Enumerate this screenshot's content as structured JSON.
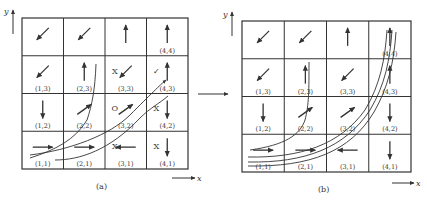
{
  "panels": [
    {
      "id": "a",
      "caption": "(a)",
      "x_axis": "x",
      "y_axis": "y",
      "cells": [
        {
          "col": 1,
          "row": 4,
          "label": "",
          "arrow": "down-left",
          "mark": ""
        },
        {
          "col": 2,
          "row": 4,
          "label": "",
          "arrow": "down-left",
          "mark": ""
        },
        {
          "col": 3,
          "row": 4,
          "label": "",
          "arrow": "up",
          "mark": ""
        },
        {
          "col": 4,
          "row": 4,
          "label": "(4,4)",
          "arrow": "up",
          "mark": ""
        },
        {
          "col": 1,
          "row": 3,
          "label": "(1,3)",
          "arrow": "down-left",
          "mark": ""
        },
        {
          "col": 2,
          "row": 3,
          "label": "(2,3)",
          "arrow": "up",
          "mark": ""
        },
        {
          "col": 3,
          "row": 3,
          "label": "(3,3)",
          "arrow": "down-left",
          "mark": "X"
        },
        {
          "col": 4,
          "row": 3,
          "label": "(4,3)",
          "arrow": "up",
          "mark": "✓"
        },
        {
          "col": 1,
          "row": 2,
          "label": "(1,2)",
          "arrow": "down",
          "mark": ""
        },
        {
          "col": 2,
          "row": 2,
          "label": "(2,2)",
          "arrow": "up-right",
          "mark": ""
        },
        {
          "col": 3,
          "row": 2,
          "label": "(3,2)",
          "arrow": "up-right",
          "mark": "O"
        },
        {
          "col": 4,
          "row": 2,
          "label": "(4,2)",
          "arrow": "down",
          "mark": "X"
        },
        {
          "col": 1,
          "row": 1,
          "label": "(1,1)",
          "arrow": "right",
          "mark": ""
        },
        {
          "col": 2,
          "row": 1,
          "label": "(2,1)",
          "arrow": "right",
          "mark": ""
        },
        {
          "col": 3,
          "row": 1,
          "label": "(3,1)",
          "arrow": "left",
          "mark": "X"
        },
        {
          "col": 4,
          "row": 1,
          "label": "(4,1)",
          "arrow": "down",
          "mark": "X"
        }
      ]
    },
    {
      "id": "b",
      "caption": "(b)",
      "x_axis": "x",
      "y_axis": "y",
      "cells": [
        {
          "col": 1,
          "row": 4,
          "label": "",
          "arrow": "down-left",
          "mark": ""
        },
        {
          "col": 2,
          "row": 4,
          "label": "",
          "arrow": "down-left",
          "mark": ""
        },
        {
          "col": 3,
          "row": 4,
          "label": "",
          "arrow": "up",
          "mark": ""
        },
        {
          "col": 4,
          "row": 4,
          "label": "(4,4)",
          "arrow": "up",
          "mark": ""
        },
        {
          "col": 1,
          "row": 3,
          "label": "(1,3)",
          "arrow": "down-left",
          "mark": ""
        },
        {
          "col": 2,
          "row": 3,
          "label": "(2,3)",
          "arrow": "up",
          "mark": ""
        },
        {
          "col": 3,
          "row": 3,
          "label": "(3,3)",
          "arrow": "down-left",
          "mark": ""
        },
        {
          "col": 4,
          "row": 3,
          "label": "(4,3)",
          "arrow": "up",
          "mark": ""
        },
        {
          "col": 1,
          "row": 2,
          "label": "(1,2)",
          "arrow": "down",
          "mark": ""
        },
        {
          "col": 2,
          "row": 2,
          "label": "(2,2)",
          "arrow": "up-right",
          "mark": ""
        },
        {
          "col": 3,
          "row": 2,
          "label": "(3,2)",
          "arrow": "up-right",
          "mark": ""
        },
        {
          "col": 4,
          "row": 2,
          "label": "(4,2)",
          "arrow": "down",
          "mark": ""
        },
        {
          "col": 1,
          "row": 1,
          "label": "(1,1)",
          "arrow": "right",
          "mark": ""
        },
        {
          "col": 2,
          "row": 1,
          "label": "(2,1)",
          "arrow": "right",
          "mark": ""
        },
        {
          "col": 3,
          "row": 1,
          "label": "(3,1)",
          "arrow": "left",
          "mark": ""
        },
        {
          "col": 4,
          "row": 1,
          "label": "(4,1)",
          "arrow": "down",
          "mark": ""
        }
      ]
    }
  ],
  "transition_arrow": "→"
}
